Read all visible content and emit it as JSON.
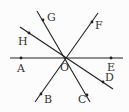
{
  "diagram": {
    "type": "geometry",
    "center": {
      "label": "O",
      "x": 66,
      "y": 58,
      "label_x": 60,
      "label_y": 71
    },
    "lines": [
      {
        "name": "line-AE",
        "x1": 10,
        "y1": 58,
        "x2": 123,
        "y2": 58
      },
      {
        "name": "line-GC",
        "x1": 37,
        "y1": 11,
        "x2": 90,
        "y2": 102
      },
      {
        "name": "line-HD",
        "x1": 20,
        "y1": 27,
        "x2": 113,
        "y2": 89
      },
      {
        "name": "line-FB",
        "x1": 98,
        "y1": 13,
        "x2": 35,
        "y2": 102
      }
    ],
    "points": [
      {
        "label": "A",
        "x": 21,
        "y": 58,
        "label_x": 17,
        "label_y": 72
      },
      {
        "label": "E",
        "x": 111,
        "y": 58,
        "label_x": 107,
        "label_y": 71
      },
      {
        "label": "G",
        "x": 43,
        "y": 20,
        "label_x": 47,
        "label_y": 21
      },
      {
        "label": "C",
        "x": 87,
        "y": 95,
        "label_x": 78,
        "label_y": 103
      },
      {
        "label": "H",
        "x": 29,
        "y": 33,
        "label_x": 18,
        "label_y": 45
      },
      {
        "label": "D",
        "x": 103,
        "y": 82,
        "label_x": 105,
        "label_y": 81
      },
      {
        "label": "F",
        "x": 92,
        "y": 22,
        "label_x": 95,
        "label_y": 29
      },
      {
        "label": "B",
        "x": 41,
        "y": 94,
        "label_x": 44,
        "label_y": 103
      }
    ],
    "colors": {
      "line": "#222222",
      "point": "#222222",
      "label": "#333333",
      "background": "#fcfcfc"
    }
  }
}
